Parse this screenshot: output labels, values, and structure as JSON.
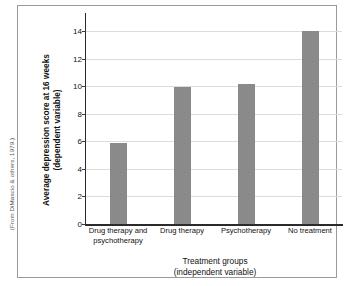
{
  "chart_data": {
    "type": "bar",
    "title": "",
    "categories": [
      "Drug therapy and psychotherapy",
      "Drug therapy",
      "Psychotherapy",
      "No treatment"
    ],
    "category_lines": [
      [
        "Drug therapy and",
        "psychotherapy"
      ],
      [
        "Drug therapy",
        ""
      ],
      [
        "Psychotherapy",
        ""
      ],
      [
        "No treatment",
        ""
      ]
    ],
    "values": [
      5.9,
      9.95,
      10.15,
      14.0
    ],
    "xlabel": "Treatment groups (independent variable)",
    "xlabel_lines": [
      "Treatment groups",
      "(independent variable)"
    ],
    "ylabel": "Average depression score at 16 weeks (dependent variable)",
    "ylabel_lines": [
      "Average depression score at 16 weeks",
      "(dependent variable)"
    ],
    "ylim": [
      0,
      14
    ],
    "yticks": [
      0,
      2,
      4,
      6,
      8,
      10,
      12,
      14
    ],
    "ytick_labels": [
      "0",
      "2",
      "4",
      "6",
      "8",
      "10",
      "12",
      "14"
    ],
    "grid": true,
    "legend": false,
    "bar_color": "#8a8a8a",
    "gridline_color": "#dcdcdc",
    "axis_color": "#2b2b2b",
    "frame_color": "#9a9a9a",
    "background_color": "#ffffff"
  },
  "source_credit": "(From DiMascio & others, 1979.)"
}
